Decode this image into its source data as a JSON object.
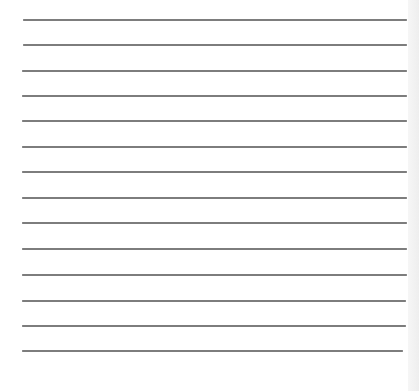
{
  "page": {
    "type": "lined-paper",
    "background_color": "#ffffff",
    "line_color": "#7d7d7d",
    "edge_strip_color": "#f0f0f0"
  },
  "lines": [
    {
      "y": 20,
      "x1": 23,
      "x2": 407
    },
    {
      "y": 45,
      "x1": 23,
      "x2": 407
    },
    {
      "y": 71,
      "x1": 22,
      "x2": 407
    },
    {
      "y": 96,
      "x1": 22,
      "x2": 407
    },
    {
      "y": 121,
      "x1": 22,
      "x2": 407
    },
    {
      "y": 147,
      "x1": 22,
      "x2": 407
    },
    {
      "y": 172,
      "x1": 22,
      "x2": 407
    },
    {
      "y": 198,
      "x1": 22,
      "x2": 407
    },
    {
      "y": 223,
      "x1": 22,
      "x2": 407
    },
    {
      "y": 249,
      "x1": 22,
      "x2": 407
    },
    {
      "y": 275,
      "x1": 22,
      "x2": 407
    },
    {
      "y": 301,
      "x1": 22,
      "x2": 406
    },
    {
      "y": 326,
      "x1": 22,
      "x2": 406
    },
    {
      "y": 351,
      "x1": 22,
      "x2": 403
    }
  ]
}
